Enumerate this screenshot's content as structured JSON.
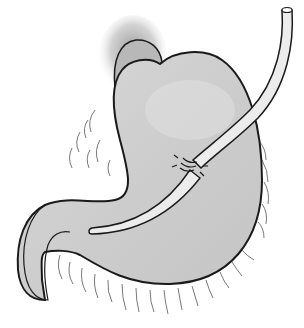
{
  "illustration": {
    "subject": "stomach-with-gastrostomy-tube",
    "width": 304,
    "height": 328,
    "colors": {
      "background": "#ffffff",
      "stomach_fill": "#cfcfcf",
      "stomach_highlight": "#e2e2e2",
      "outline": "#1a1a1a",
      "tube_fill": "#ececec",
      "esophagus_shadow": "#9a9a9a",
      "omentum_stroke": "#444444"
    },
    "parts": [
      "esophagus",
      "stomach-body",
      "duodenum",
      "omentum",
      "gastrostomy-tube",
      "insertion-site"
    ]
  }
}
